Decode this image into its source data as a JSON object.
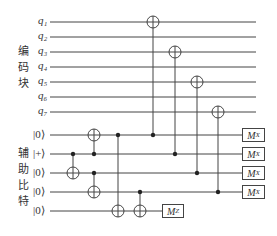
{
  "groups": {
    "encoding": {
      "label_chars": [
        "编",
        "码",
        "块"
      ]
    },
    "ancilla": {
      "label_chars": [
        "辅",
        "助",
        "比",
        "特"
      ]
    }
  },
  "data_qubits": [
    {
      "label": "q",
      "sub": "1",
      "y": 22
    },
    {
      "label": "q",
      "sub": "2",
      "y": 37
    },
    {
      "label": "q",
      "sub": "3",
      "y": 52
    },
    {
      "label": "q",
      "sub": "4",
      "y": 67
    },
    {
      "label": "q",
      "sub": "5",
      "y": 82
    },
    {
      "label": "q",
      "sub": "6",
      "y": 97
    },
    {
      "label": "q",
      "sub": "7",
      "y": 112
    }
  ],
  "ancilla_qubits": [
    {
      "state": "|0⟩",
      "y": 135
    },
    {
      "state": "|+⟩",
      "y": 154
    },
    {
      "state": "|0⟩",
      "y": 173
    },
    {
      "state": "|0⟩",
      "y": 192
    },
    {
      "state": "|0⟩",
      "y": 211
    }
  ],
  "wire": {
    "x_start": 50,
    "x_end": 256,
    "color": "#444444"
  },
  "cnots": [
    {
      "x": 73,
      "control": "a2",
      "target": "a3"
    },
    {
      "x": 94,
      "control": "a2",
      "target": "a1"
    },
    {
      "x": 94,
      "control": "a3",
      "target": "a4"
    },
    {
      "x": 118,
      "control": "a1",
      "target": "a5"
    },
    {
      "x": 140,
      "control": "a4",
      "target": "a5"
    },
    {
      "x": 153,
      "control": "a1",
      "target": "q1"
    },
    {
      "x": 175,
      "control": "a2",
      "target": "q3"
    },
    {
      "x": 197,
      "control": "a3",
      "target": "q5"
    },
    {
      "x": 218,
      "control": "a4",
      "target": "q7"
    }
  ],
  "measurements": [
    {
      "wire": "a1",
      "label": "M",
      "sub": "X"
    },
    {
      "wire": "a2",
      "label": "M",
      "sub": "X"
    },
    {
      "wire": "a3",
      "label": "M",
      "sub": "X"
    },
    {
      "wire": "a4",
      "label": "M",
      "sub": "X"
    },
    {
      "wire": "a5",
      "label": "M",
      "sub": "Z"
    }
  ],
  "text": {
    "q1": "q₁",
    "q2": "q₂",
    "q3": "q₃",
    "q4": "q₄",
    "q5": "q₅",
    "q6": "q₆",
    "q7": "q₇",
    "a1": "|0⟩",
    "a2": "|+⟩",
    "a3": "|0⟩",
    "a4": "|0⟩",
    "a5": "|0⟩",
    "mx1": "M",
    "mx2": "M",
    "mx3": "M",
    "mx4": "M",
    "mz": "M",
    "sx": "X",
    "sz": "Z",
    "enc1": "编",
    "enc2": "码",
    "enc3": "块",
    "anc1": "辅",
    "anc2": "助",
    "anc3": "比",
    "anc4": "特"
  }
}
